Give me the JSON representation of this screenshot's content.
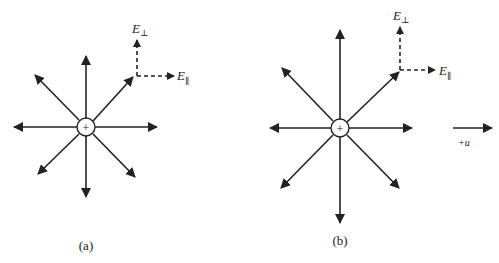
{
  "diagram": {
    "panels": [
      {
        "id": "a",
        "caption": "(a)",
        "charge_symbol": "+",
        "center": [
          86,
          127
        ],
        "field_lines": 8,
        "e_perp_label": "E",
        "e_perp_sub": "⊥",
        "e_par_label": "E",
        "e_par_sub": "∥"
      },
      {
        "id": "b",
        "caption": "(b)",
        "charge_symbol": "+",
        "center": [
          340,
          128
        ],
        "field_lines": 8,
        "e_perp_label": "E",
        "e_perp_sub": "⊥",
        "e_par_label": "E",
        "e_par_sub": "∥",
        "velocity_label": "+u"
      }
    ],
    "colors": {
      "line": "#222222",
      "background": "#ffffff"
    }
  }
}
